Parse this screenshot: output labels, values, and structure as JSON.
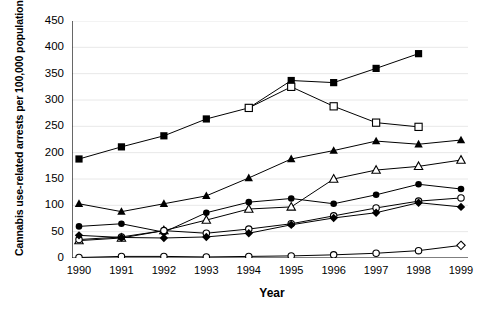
{
  "chart_data": {
    "type": "line",
    "title": "",
    "xlabel": "Year",
    "ylabel": "Cannabis use-related arrests per 100,000 population",
    "categories": [
      1990,
      1991,
      1992,
      1993,
      1994,
      1995,
      1996,
      1997,
      1998,
      1999
    ],
    "xtick_labels": [
      "1990",
      "1991",
      "1992",
      "1993",
      "1994",
      "1995",
      "1996",
      "1997",
      "1998",
      "1999"
    ],
    "ytick_labels": [
      "0",
      "50",
      "100",
      "150",
      "200",
      "250",
      "300",
      "350",
      "400",
      "450"
    ],
    "ylim": [
      0,
      450
    ],
    "ytick_step": 50,
    "grid": "horizontal",
    "legend": "none",
    "series": [
      {
        "name": "series-filled-square",
        "marker": "filled-square",
        "values": [
          188,
          211,
          232,
          264,
          285,
          337,
          333,
          360,
          388,
          null
        ]
      },
      {
        "name": "series-open-square",
        "marker": "open-square",
        "values": [
          null,
          null,
          null,
          null,
          285,
          325,
          288,
          257,
          249,
          null
        ]
      },
      {
        "name": "series-filled-triangle",
        "marker": "filled-triangle",
        "values": [
          103,
          88,
          103,
          118,
          152,
          188,
          204,
          222,
          216,
          224
        ]
      },
      {
        "name": "series-open-triangle",
        "marker": "open-triangle",
        "values": [
          33,
          38,
          52,
          72,
          93,
          97,
          150,
          167,
          174,
          186
        ]
      },
      {
        "name": "series-filled-circle",
        "marker": "filled-circle",
        "values": [
          60,
          65,
          49,
          86,
          106,
          113,
          103,
          120,
          140,
          131
        ]
      },
      {
        "name": "series-open-circle-upper",
        "marker": "open-circle",
        "values": [
          35,
          40,
          52,
          47,
          55,
          65,
          80,
          95,
          108,
          114
        ]
      },
      {
        "name": "series-filled-diamond",
        "marker": "filled-diamond",
        "values": [
          43,
          39,
          38,
          40,
          47,
          63,
          76,
          86,
          105,
          97
        ]
      },
      {
        "name": "series-open-circle-lower",
        "marker": "open-circle",
        "values": [
          1,
          3,
          3,
          2,
          3,
          4,
          6,
          9,
          14,
          24
        ],
        "last_marker": "open-diamond"
      }
    ]
  }
}
